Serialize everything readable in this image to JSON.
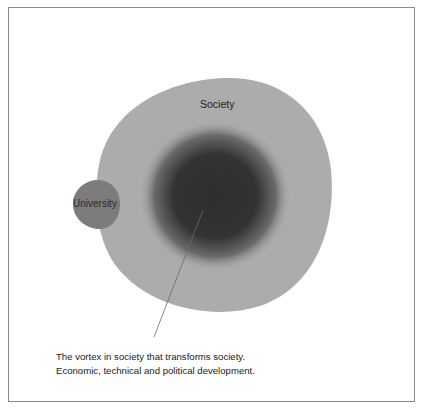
{
  "diagram": {
    "labels": {
      "society": "Society",
      "university": "University"
    },
    "caption": {
      "line1": "The vortex in society that transforms society.",
      "line2": "Economic, technical and political development."
    },
    "colors": {
      "society_fill": "#acacac",
      "university_fill": "#7c7c7c",
      "vortex_core": "#2e2e2e",
      "border": "#8a8a8a",
      "pointer_line": "#6a6a6a"
    }
  }
}
